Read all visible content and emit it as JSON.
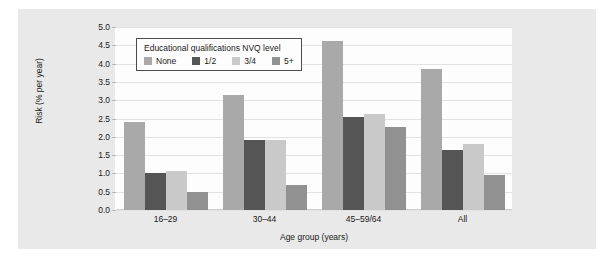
{
  "chart_data": {
    "type": "bar",
    "title": "",
    "xlabel": "Age group (years)",
    "ylabel": "Risk (% per year)",
    "categories": [
      "16–29",
      "30–44",
      "45–59/64",
      "All"
    ],
    "series": [
      {
        "name": "None",
        "color": "#a9a9a9",
        "values": [
          2.4,
          3.15,
          4.62,
          3.85
        ]
      },
      {
        "name": "1/2",
        "color": "#555555",
        "values": [
          1.0,
          1.9,
          2.55,
          1.63
        ]
      },
      {
        "name": "3/4",
        "color": "#c9c9c9",
        "values": [
          1.06,
          1.92,
          2.62,
          1.8
        ]
      },
      {
        "name": "5+",
        "color": "#919191",
        "values": [
          0.5,
          0.68,
          2.27,
          0.97
        ]
      }
    ],
    "ylim": [
      0.0,
      5.0
    ],
    "ytick_labels": [
      "5.0",
      "4.5",
      "4.0",
      "3.5",
      "3.0",
      "2.5",
      "2.0",
      "1.5",
      "1.0",
      "0.5",
      "0.0"
    ],
    "ytick_values": [
      5.0,
      4.5,
      4.0,
      3.5,
      3.0,
      2.5,
      2.0,
      1.5,
      1.0,
      0.5,
      0.0
    ],
    "grid": true,
    "legend_position": "top-left",
    "legend_title": "Educational qualifications NVQ level"
  },
  "legend": {
    "title": "Educational qualifications NVQ level",
    "items": [
      {
        "label": "None",
        "color": "#a9a9a9"
      },
      {
        "label": "1/2",
        "color": "#555555"
      },
      {
        "label": "3/4",
        "color": "#c9c9c9"
      },
      {
        "label": "5+",
        "color": "#919191"
      }
    ]
  },
  "colors": {
    "panel_background": "#e9e9e9",
    "plot_background": "#fdfdfd",
    "gridline": "#e2e2e2",
    "text": "#1a1a1a",
    "legend_border": "#4d4d4d"
  }
}
